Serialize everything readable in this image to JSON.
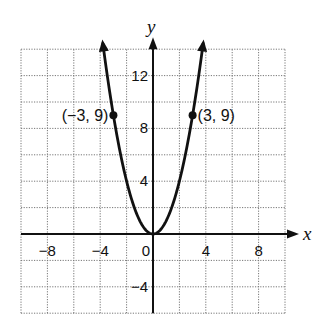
{
  "chart_data": {
    "type": "line",
    "title": "",
    "function": "y = x^2",
    "xlabel": "x",
    "ylabel": "y",
    "xlim": [
      -10,
      10
    ],
    "ylim": [
      -6,
      14
    ],
    "grid": true,
    "grid_step": 2,
    "x_ticks": [
      -8,
      -4,
      0,
      4,
      8
    ],
    "y_ticks": [
      -4,
      4,
      8,
      12
    ],
    "x_tick_labels": [
      "−8",
      "−4",
      "0",
      "4",
      "8"
    ],
    "y_tick_labels": [
      "−4",
      "4",
      "8",
      "12"
    ],
    "series": [
      {
        "name": "parabola",
        "x": [
          -3.8,
          -3,
          -2,
          -1,
          0,
          1,
          2,
          3,
          3.8
        ],
        "y": [
          14.44,
          9,
          4,
          1,
          0,
          1,
          4,
          9,
          14.44
        ]
      }
    ],
    "points": [
      {
        "x": -3,
        "y": 9,
        "label": "(−3, 9)"
      },
      {
        "x": 3,
        "y": 9,
        "label": "(3, 9)"
      }
    ]
  }
}
